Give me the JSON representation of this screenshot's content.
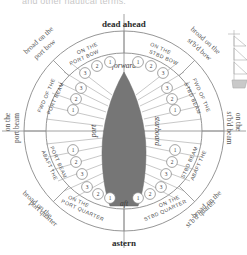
{
  "figure": {
    "truncated_caption_top": "and other nautical terms.",
    "hull_color": "#767676",
    "line_color": "#7d7d7d",
    "background": "#ffffff",
    "center": {
      "x": 124,
      "y": 131
    },
    "outer_radius": 100,
    "inner_radius": 78
  },
  "cardinals": {
    "ahead": "dead ahead",
    "astern": "astern"
  },
  "axes": {
    "forward": "forward",
    "aft": "aft",
    "port": "port",
    "starboard": "starboard"
  },
  "sectors": [
    {
      "id": "port-bow",
      "label": "ON THE PORT BOW",
      "outer": "broad on the port bow",
      "numbers": [
        1,
        2,
        3
      ]
    },
    {
      "id": "stbd-bow",
      "label": "ON THE STBD BOW",
      "outer": "broad on the st'b'd bow",
      "numbers": [
        1,
        2,
        3
      ]
    },
    {
      "id": "fwd-port-beam",
      "label": "FWD OF THE PORT BEAM",
      "outer": "on the port beam",
      "numbers": [
        1,
        2,
        3
      ]
    },
    {
      "id": "fwd-stbd-beam",
      "label": "FWD OF THE STBD BEAM",
      "outer": "on the st'b'd beam",
      "numbers": [
        1,
        2,
        3
      ]
    },
    {
      "id": "abaft-port-beam",
      "label": "ABAFT THE PORT BEAM",
      "outer": "",
      "numbers": [
        1,
        2,
        3
      ]
    },
    {
      "id": "abaft-stbd-beam",
      "label": "ABAFT THE STBD BEAM",
      "outer": "",
      "numbers": [
        1,
        2,
        3
      ]
    },
    {
      "id": "port-quarter",
      "label": "ON THE PORT QUARTER",
      "outer": "broad on the port quarter",
      "numbers": [
        1,
        2,
        3
      ]
    },
    {
      "id": "stbd-quarter",
      "label": "ON THE STBD QUARTER",
      "outer": "broad on the st'b'd quarter",
      "numbers": [
        1,
        2,
        3
      ]
    }
  ],
  "sector_labels": {
    "port_bow": "ON THE",
    "port_bow2": "PORT BOW",
    "stbd_bow": "ON THE",
    "stbd_bow2": "STBD BOW",
    "fwd_port": "FWD OF THE",
    "fwd_port2": "PORT BEAM",
    "fwd_stbd": "FWD OF THE",
    "fwd_stbd2": "STBD BEAM",
    "abaft_port": "ABAFT THE",
    "abaft_port2": "PORT BEAM",
    "abaft_stbd": "ABAFT THE",
    "abaft_stbd2": "STBD BEAM",
    "port_qtr": "ON THE",
    "port_qtr2": "PORT QUARTER",
    "stbd_qtr": "ON THE",
    "stbd_qtr2": "STBD QUARTER"
  },
  "outer_labels": {
    "nw1": "broad on the",
    "nw2": "port bow",
    "ne1": "broad on the",
    "ne2": "st'b'd bow",
    "w1": "on the",
    "w2": "port beam",
    "e1": "on the",
    "e2": "st'b'd beam",
    "sw1": "broad on the",
    "sw2": "port quarter",
    "se1": "broad on the",
    "se2": "st'b'd quarter"
  },
  "side_illustration": {
    "name": "sailing-ship-vignette",
    "visible": true
  }
}
